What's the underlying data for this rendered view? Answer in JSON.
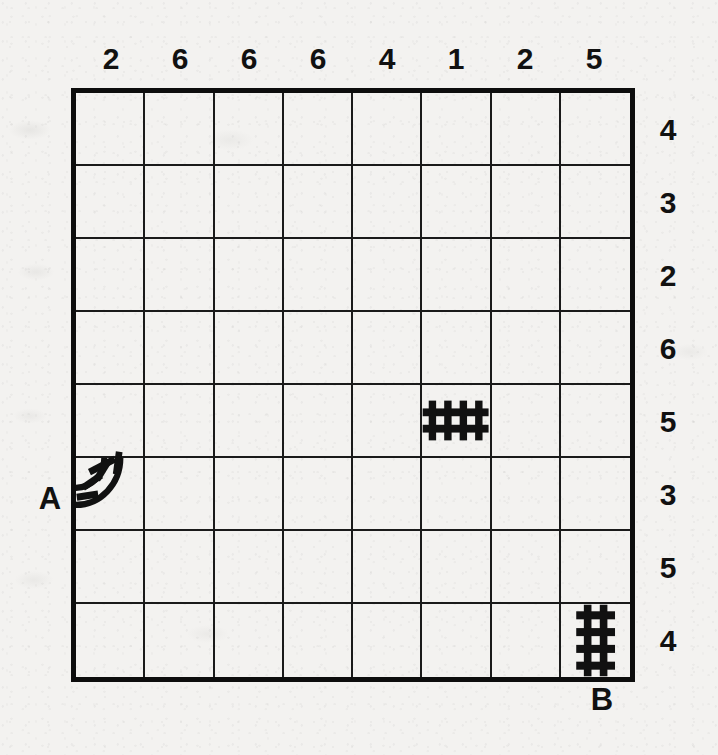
{
  "puzzle": {
    "type": "railroad-track-logic-puzzle",
    "grid": {
      "columns": 8,
      "rows": 8
    },
    "column_clues": [
      2,
      6,
      6,
      6,
      4,
      1,
      2,
      5
    ],
    "row_clues": [
      4,
      3,
      2,
      6,
      5,
      3,
      5,
      4
    ],
    "endpoints": [
      {
        "label": "A",
        "side": "left",
        "row": 6
      },
      {
        "label": "B",
        "side": "bottom",
        "column": 8
      }
    ],
    "given_pieces": [
      {
        "kind": "track-straight-horizontal",
        "row": 5,
        "column": 6
      },
      {
        "kind": "track-curve-top-left",
        "row": 6,
        "column": 1
      },
      {
        "kind": "track-straight-vertical",
        "row": 8,
        "column": 8
      }
    ],
    "colors": {
      "ink": "#111111",
      "grid_line": "#1a1a1a",
      "border": "#0d0d0d",
      "paper": "#f3f2f0"
    }
  }
}
